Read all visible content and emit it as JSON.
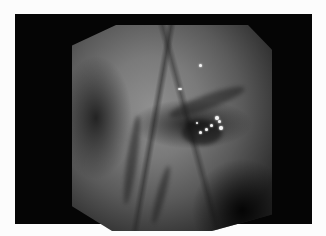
{
  "image": {
    "description": "Grayscale endoscopic view of mucosal tissue with folds and specular highlights, inside an octagonal mask on a black frame",
    "colors": {
      "background": "#fcfcfc",
      "frame": "#050505",
      "tissue_light": "#8f8f8f",
      "tissue_dark": "#2a2a2a",
      "highlight": "#f4f4f4"
    },
    "highlights": [
      {
        "x": 199,
        "y": 64
      },
      {
        "x": 178,
        "y": 88
      },
      {
        "x": 215,
        "y": 117
      },
      {
        "x": 218,
        "y": 120
      },
      {
        "x": 210,
        "y": 124
      },
      {
        "x": 220,
        "y": 127
      },
      {
        "x": 200,
        "y": 132
      },
      {
        "x": 205,
        "y": 128
      }
    ]
  }
}
